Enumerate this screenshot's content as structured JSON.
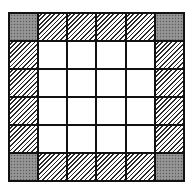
{
  "diagram": {
    "type": "grid",
    "rows": 6,
    "columns": 6,
    "legend_note": "corner cells gray stippled, border cells diagonally hatched, interior cells white",
    "colors": {
      "grid_line": "#111111",
      "corner_fill": "#8c8c8c",
      "hatch": "#2a2a2a",
      "empty": "#ffffff"
    },
    "cells": [
      [
        "corner",
        "edge",
        "edge",
        "edge",
        "edge",
        "corner"
      ],
      [
        "edge",
        "empty",
        "empty",
        "empty",
        "empty",
        "edge"
      ],
      [
        "edge",
        "empty",
        "empty",
        "empty",
        "empty",
        "edge"
      ],
      [
        "edge",
        "empty",
        "empty",
        "empty",
        "empty",
        "edge"
      ],
      [
        "edge",
        "empty",
        "empty",
        "empty",
        "empty",
        "edge"
      ],
      [
        "corner",
        "edge",
        "edge",
        "edge",
        "edge",
        "corner"
      ]
    ]
  }
}
